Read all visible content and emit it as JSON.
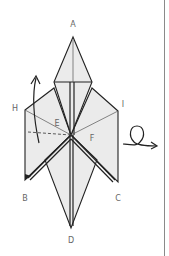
{
  "diagram": {
    "title": "",
    "labels": {
      "A": "A",
      "B": "B",
      "C": "C",
      "D": "D",
      "E": "E",
      "F": "F",
      "H": "H",
      "I": "I"
    },
    "symbols": {
      "fold_arrow": "curved-arrow-up-icon",
      "turn_over": "loop-arrow-turn-over-icon"
    },
    "colors": {
      "paper": "#ebebeb",
      "line": "#222222",
      "label": "#666666",
      "divider": "#8a8a8a"
    }
  }
}
